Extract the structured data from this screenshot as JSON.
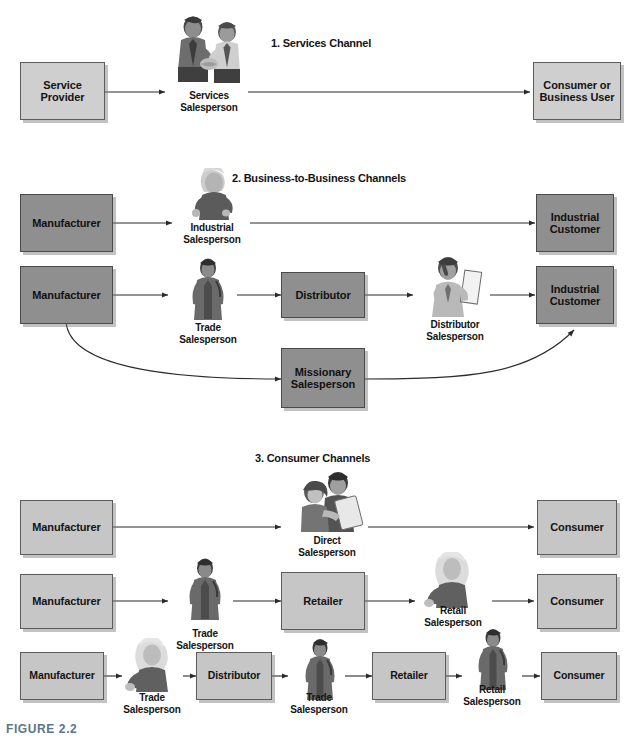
{
  "figure": {
    "caption": "FIGURE 2.2"
  },
  "sections": [
    {
      "id": "services",
      "title": "1. Services Channel"
    },
    {
      "id": "b2b",
      "title": "2. Business-to-Business Channels"
    },
    {
      "id": "consumer",
      "title": "3. Consumer Channels"
    }
  ],
  "boxes": {
    "s1_provider": "Service\nProvider",
    "s1_consumer": "Consumer or\nBusiness User",
    "s2_mfr_a": "Manufacturer",
    "s2_cust_a": "Industrial\nCustomer",
    "s2_mfr_b": "Manufacturer",
    "s2_distributor": "Distributor",
    "s2_cust_b": "Industrial\nCustomer",
    "s2_missionary": "Missionary\nSalesperson",
    "s3_mfr_1": "Manufacturer",
    "s3_consumer_1": "Consumer",
    "s3_mfr_2": "Manufacturer",
    "s3_retailer_2": "Retailer",
    "s3_consumer_2": "Consumer",
    "s3_mfr_3": "Manufacturer",
    "s3_distributor_3": "Distributor",
    "s3_retailer_3": "Retailer",
    "s3_consumer_3": "Consumer"
  },
  "people": {
    "s1_services": "Services\nSalesperson",
    "s2_industrial": "Industrial\nSalesperson",
    "s2_trade": "Trade\nSalesperson",
    "s2_distributor": "Distributor\nSalesperson",
    "s3_direct": "Direct\nSalesperson",
    "s3_trade_2": "Trade\nSalesperson",
    "s3_retail_2": "Retail\nSalesperson",
    "s3_trade_3a": "Trade\nSalesperson",
    "s3_trade_3b": "Trade\nSalesperson",
    "s3_retail_3": "Retail\nSalesperson"
  },
  "colors": {
    "box_light": "#cfcfcf",
    "box_mid": "#8f8f8f",
    "box_pale": "#c6c6c6",
    "line": "#2b2b2b",
    "caption": "#5b7490",
    "text": "#141414"
  }
}
